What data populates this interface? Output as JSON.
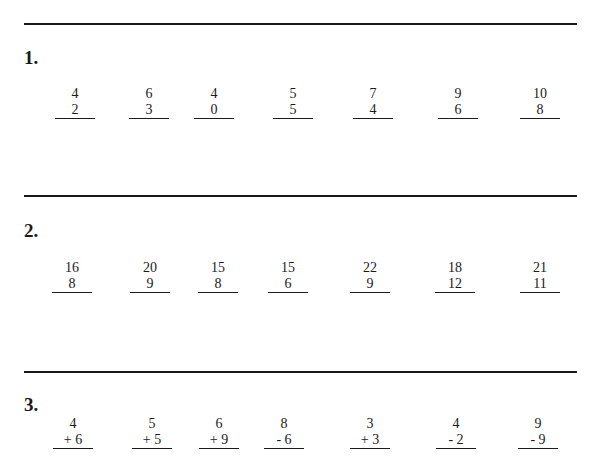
{
  "sections": [
    {
      "label": "1.",
      "problems": [
        {
          "top": "4",
          "bottom": "2"
        },
        {
          "top": "6",
          "bottom": "3"
        },
        {
          "top": "4",
          "bottom": "0"
        },
        {
          "top": "5",
          "bottom": "5"
        },
        {
          "top": "7",
          "bottom": "4"
        },
        {
          "top": "9",
          "bottom": "6"
        },
        {
          "top": "10",
          "bottom": "8"
        }
      ]
    },
    {
      "label": "2.",
      "problems": [
        {
          "top": "16",
          "bottom": "8"
        },
        {
          "top": "20",
          "bottom": "9"
        },
        {
          "top": "15",
          "bottom": "8"
        },
        {
          "top": "15",
          "bottom": "6"
        },
        {
          "top": "22",
          "bottom": "9"
        },
        {
          "top": "18",
          "bottom": "12"
        },
        {
          "top": "21",
          "bottom": "11"
        }
      ]
    },
    {
      "label": "3.",
      "problems": [
        {
          "top": "4",
          "bottom": "+ 6"
        },
        {
          "top": "5",
          "bottom": "+ 5"
        },
        {
          "top": "6",
          "bottom": "+ 9"
        },
        {
          "top": "8",
          "bottom": "- 6"
        },
        {
          "top": "3",
          "bottom": "+ 3"
        },
        {
          "top": "4",
          "bottom": "- 2"
        },
        {
          "top": "9",
          "bottom": "- 9"
        }
      ]
    }
  ]
}
